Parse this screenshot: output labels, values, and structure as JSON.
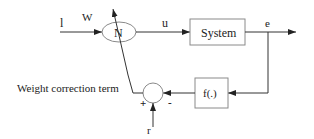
{
  "diagram": {
    "colors": {
      "line": "#333333",
      "box_stroke": "#8a8a8a",
      "text": "#222222",
      "background": "#ffffff"
    },
    "labels": {
      "input": "l",
      "weight": "W",
      "neuron": "N",
      "control": "u",
      "system": "System",
      "error": "e",
      "function": "f(.)",
      "correction": "Weight correction term",
      "plus": "+",
      "minus": "-",
      "reference": "r"
    },
    "nodes": [
      {
        "id": "neuron",
        "shape": "ellipse",
        "label": "N"
      },
      {
        "id": "system",
        "shape": "box",
        "label": "System"
      },
      {
        "id": "function",
        "shape": "box",
        "label": "f(.)"
      },
      {
        "id": "summer",
        "shape": "circle",
        "signs": [
          "+",
          "-"
        ]
      }
    ],
    "edges": [
      {
        "from": "input",
        "to": "neuron",
        "label": "l"
      },
      {
        "from": "neuron",
        "to": "system",
        "label": "u"
      },
      {
        "from": "system",
        "to": "output",
        "label": "e"
      },
      {
        "from": "system",
        "to": "function",
        "label": "e (feedback)"
      },
      {
        "from": "function",
        "to": "summer",
        "sign": "-"
      },
      {
        "from": "reference",
        "to": "summer",
        "label": "r"
      },
      {
        "from": "summer",
        "to": "neuron",
        "label": "Weight correction term",
        "sign": "+"
      }
    ]
  }
}
